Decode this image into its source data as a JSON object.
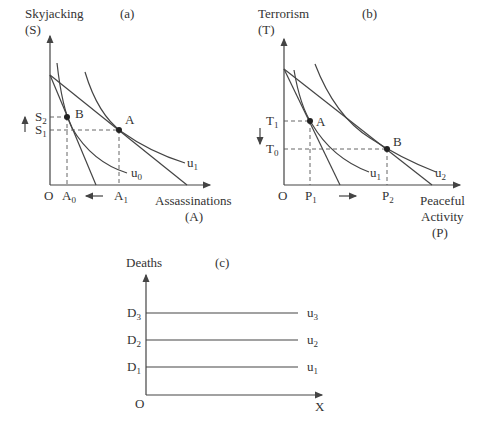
{
  "panels": {
    "a": {
      "tag": "(a)",
      "ylabel_line1": "Skyjacking",
      "ylabel_line2": "(S)",
      "xlabel_line1": "Assassinations",
      "xlabel_line2": "(A)",
      "origin": "O",
      "points": {
        "B": "B",
        "A": "A"
      },
      "y_ticks": [
        {
          "base": "S",
          "sub": "2"
        },
        {
          "base": "S",
          "sub": "1"
        }
      ],
      "x_ticks": [
        {
          "base": "A",
          "sub": "0"
        },
        {
          "base": "A",
          "sub": "1"
        }
      ],
      "curves": [
        {
          "base": "u",
          "sub": "0"
        },
        {
          "base": "u",
          "sub": "1"
        }
      ],
      "y_shift_arrow": "up",
      "x_shift_arrow": "left"
    },
    "b": {
      "tag": "(b)",
      "ylabel_line1": "Terrorism",
      "ylabel_line2": "(T)",
      "xlabel_line1": "Peaceful",
      "xlabel_line2": "Activity",
      "xlabel_line3": "(P)",
      "origin": "O",
      "points": {
        "A": "A",
        "B": "B"
      },
      "y_ticks": [
        {
          "base": "T",
          "sub": "1"
        },
        {
          "base": "T",
          "sub": "0"
        }
      ],
      "x_ticks": [
        {
          "base": "P",
          "sub": "1"
        },
        {
          "base": "P",
          "sub": "2"
        }
      ],
      "curves": [
        {
          "base": "u",
          "sub": "1"
        },
        {
          "base": "u",
          "sub": "2"
        }
      ],
      "y_shift_arrow": "down",
      "x_shift_arrow": "right"
    },
    "c": {
      "tag": "(c)",
      "ylabel": "Deaths",
      "xlabel": "X",
      "origin": "O",
      "levels": [
        {
          "d_base": "D",
          "d_sub": "3",
          "u_base": "u",
          "u_sub": "3"
        },
        {
          "d_base": "D",
          "d_sub": "2",
          "u_base": "u",
          "u_sub": "2"
        },
        {
          "d_base": "D",
          "d_sub": "1",
          "u_base": "u",
          "u_sub": "1"
        }
      ]
    }
  }
}
